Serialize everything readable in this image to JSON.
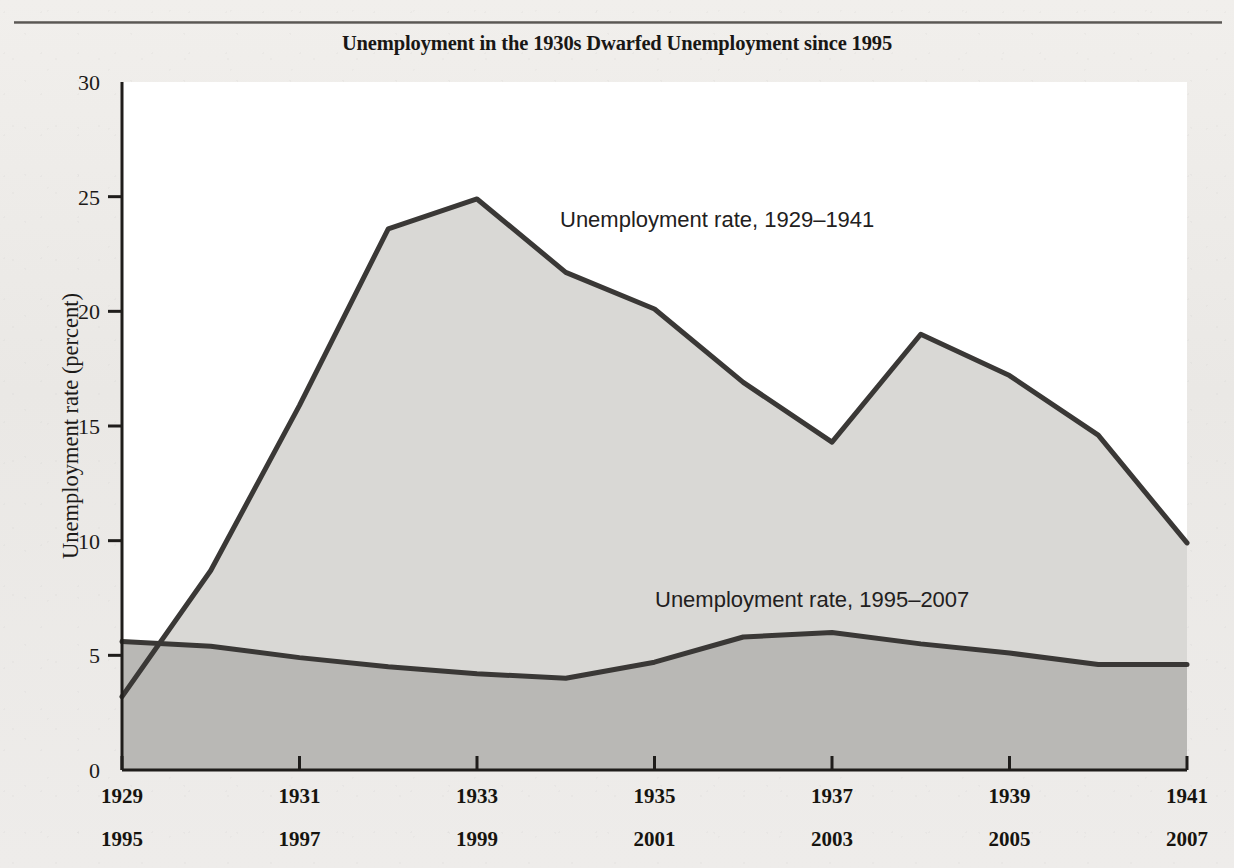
{
  "chart_data": {
    "type": "area",
    "title": "Unemployment in the 1930s Dwarfed Unemployment since 1995",
    "xlabel": "",
    "ylabel": "Unemployment rate (percent)",
    "ylim": [
      0,
      30
    ],
    "yticks": [
      "0",
      "5",
      "10",
      "15",
      "20",
      "25",
      "30"
    ],
    "grid": false,
    "legend_position": "inline-annotation",
    "x_axis_rows": [
      {
        "row_id": "depression-years",
        "ticks": [
          "1929",
          "1931",
          "1933",
          "1935",
          "1937",
          "1939",
          "1941"
        ]
      },
      {
        "row_id": "modern-years",
        "ticks": [
          "1995",
          "1997",
          "1999",
          "2001",
          "2003",
          "2005",
          "2007"
        ]
      }
    ],
    "x": [
      0,
      1,
      2,
      3,
      4,
      5,
      6,
      7,
      8,
      9,
      10,
      11,
      12
    ],
    "series": [
      {
        "name": "Unemployment rate, 1929–1941",
        "series_id": "depression",
        "annotation": "Unemployment rate, 1929–1941",
        "x_labels": [
          "1929",
          "1930",
          "1931",
          "1932",
          "1933",
          "1934",
          "1935",
          "1936",
          "1937",
          "1938",
          "1939",
          "1940",
          "1941"
        ],
        "values": [
          3.2,
          8.7,
          15.9,
          23.6,
          24.9,
          21.7,
          20.1,
          16.9,
          14.3,
          19.0,
          17.2,
          14.6,
          9.9
        ],
        "fill_color": "#d9d8d5",
        "line_color": "#3a3836"
      },
      {
        "name": "Unemployment rate, 1995–2007",
        "series_id": "modern",
        "annotation": "Unemployment rate, 1995–2007",
        "x_labels": [
          "1995",
          "1996",
          "1997",
          "1998",
          "1999",
          "2000",
          "2001",
          "2002",
          "2003",
          "2004",
          "2005",
          "2006",
          "2007"
        ],
        "values": [
          5.6,
          5.4,
          4.9,
          4.5,
          4.2,
          4.0,
          4.7,
          5.8,
          6.0,
          5.5,
          5.1,
          4.6,
          4.6
        ],
        "fill_color": "#b9b8b5",
        "line_color": "#3a3836"
      }
    ],
    "annotations": [
      {
        "id": "annotation-depression",
        "text": "Unemployment rate, 1929–1941",
        "x_px": 560,
        "y_px": 227
      },
      {
        "id": "annotation-modern",
        "text": "Unemployment rate, 1995–2007",
        "x_px": 655,
        "y_px": 607
      }
    ]
  },
  "colors": {
    "page_background": "#eceae7",
    "plot_background": "#ffffff",
    "depression_fill": "#d9d8d5",
    "modern_fill": "#b9b8b5",
    "line": "#3a3836",
    "axis": "#1f1d1b",
    "text": "#1c1a18"
  }
}
